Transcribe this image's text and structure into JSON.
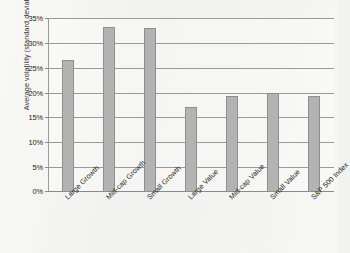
{
  "chart_data": {
    "type": "bar",
    "title": "",
    "xlabel": "",
    "ylabel": "Average volatility (standard deviation)",
    "categories": [
      "Large Growth",
      "Mid-cap Growth",
      "Small Growth",
      "Large Value",
      "Mid-cap Value",
      "Small Value",
      "S&P 500 Index"
    ],
    "values": [
      26.5,
      33.1,
      32.9,
      17.1,
      19.3,
      20.0,
      19.3
    ],
    "value_labels": [
      "26.5%",
      "33.1%",
      "32.9%",
      "17.1%",
      "19.3%",
      "20.0%",
      "19.3%"
    ],
    "ylim": [
      0,
      35
    ],
    "ytick_values": [
      0,
      5,
      10,
      15,
      20,
      25,
      30,
      35
    ],
    "ytick_labels": [
      "0%",
      "5%",
      "10%",
      "15%",
      "20%",
      "25%",
      "30%",
      "35%"
    ],
    "grid": true,
    "legend": false,
    "legend_position": "none",
    "bar_color": "#b3b3b3",
    "bar_border_color": "#8f8f8f",
    "gridline_color": "#9a9a9a",
    "background_color": "#f1f1ef",
    "text_color": "#242424"
  }
}
